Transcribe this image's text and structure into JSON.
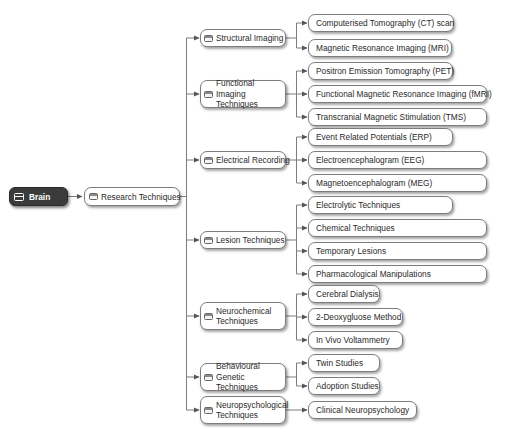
{
  "root": {
    "label": "Brain"
  },
  "research": {
    "label": "Research Techniques"
  },
  "categories": [
    {
      "label": "Structural Imaging",
      "children": [
        "Computerised Tomography (CT) scan",
        "Magnetic Resonance Imaging (MRI)"
      ]
    },
    {
      "label": "Functional Imaging Techniques",
      "children": [
        "Positron Emission Tomography (PET)",
        "Functional Magnetic Resonance Imaging (fMRI)",
        "Transcranial Magnetic Stimulation (TMS)"
      ]
    },
    {
      "label": "Electrical Recording",
      "children": [
        "Event Related Potentials (ERP)",
        "Electroencephalogram (EEG)",
        "Magnetoencephalogram (MEG)"
      ]
    },
    {
      "label": "Lesion Techniques",
      "children": [
        "Electrolytic Techniques",
        "Chemical Techniques",
        "Temporary Lesions",
        "Pharmacological Manipulations"
      ]
    },
    {
      "label": "Neurochemical Techniques",
      "children": [
        "Cerebral Dialysis",
        "2-Deoxygluose Method",
        "In Vivo Voltammetry"
      ]
    },
    {
      "label": "Behavioural Genetic Techniques",
      "children": [
        "Twin Studies",
        "Adoption Studies"
      ]
    },
    {
      "label": "Neuropsychological Techniques",
      "children": [
        "Clinical Neuropsychology"
      ]
    }
  ],
  "colors": {
    "root_bg": "#3b3b3b",
    "line": "#7d7d7d",
    "node_border": "#7d7d7d"
  }
}
